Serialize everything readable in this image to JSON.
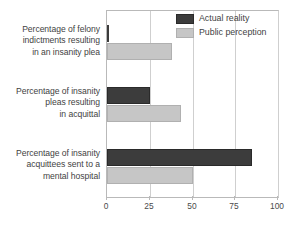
{
  "chart_data": {
    "type": "bar",
    "orientation": "horizontal",
    "title": "",
    "xlabel": "",
    "ylabel": "",
    "xlim": [
      0,
      100
    ],
    "xticks": [
      0,
      25,
      50,
      75,
      100
    ],
    "xtick_labels": [
      "0",
      "25",
      "50",
      "75",
      "100"
    ],
    "grid": true,
    "grid_axis": "x",
    "legend_position": "top-right",
    "categories": [
      "Percentage of felony indictments resulting in an insanity plea",
      "Percentage of insanity pleas resulting in acquittal",
      "Percentage of insanity acquittees sent to a mental hospital"
    ],
    "category_lines": [
      [
        "Percentage of felony",
        "indictments resulting",
        "in an insanity plea"
      ],
      [
        "Percentage of insanity",
        "pleas resulting",
        "in acquittal"
      ],
      [
        "Percentage of insanity",
        "acquittees sent to a",
        "mental hospital"
      ]
    ],
    "series": [
      {
        "name": "Actual reality",
        "color": "#3c3c3c",
        "values": [
          1,
          25,
          85
        ]
      },
      {
        "name": "Public perception",
        "color": "#c6c6c6",
        "values": [
          38,
          43,
          50
        ]
      }
    ]
  },
  "legend": {
    "items": [
      {
        "label": "Actual reality",
        "swatch": "actual"
      },
      {
        "label": "Public perception",
        "swatch": "perception"
      }
    ]
  },
  "colors": {
    "actual": "#3c3c3c",
    "perception": "#c6c6c6",
    "axis": "#b9b9b9",
    "grid": "#cfcfcf",
    "text": "#3f3f3f",
    "background": "#ffffff"
  }
}
